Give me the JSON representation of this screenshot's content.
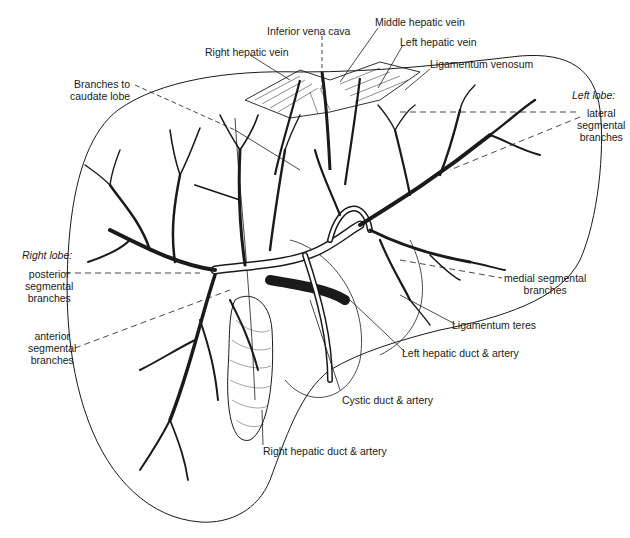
{
  "figure": {
    "style": "black-and-white pen illustration"
  },
  "labels": {
    "inferior_vena_cava": "Inferior vena cava",
    "middle_hepatic_vein": "Middle hepatic vein",
    "left_hepatic_vein": "Left hepatic vein",
    "right_hepatic_vein": "Right hepatic vein",
    "ligamentum_venosum": "Ligamentum venosum",
    "branches_to_caudate_lobe": [
      "Branches to",
      "caudate lobe"
    ],
    "left_lobe_heading": "Left lobe:",
    "left_lateral_segmental_branches": [
      "lateral",
      "segmental",
      "branches"
    ],
    "right_lobe_heading": "Right lobe:",
    "right_posterior_segmental_branches": [
      "posterior",
      "segmental",
      "branches"
    ],
    "right_anterior_segmental_branches": [
      "anterior",
      "segmental",
      "branches"
    ],
    "medial_segmental_branches": [
      "medial segmental",
      "branches"
    ],
    "ligamentum_teres": "Ligamentum teres",
    "left_hepatic_duct_artery": "Left hepatic duct & artery",
    "cystic_duct_artery": "Cystic duct & artery",
    "right_hepatic_duct_artery": "Right hepatic duct & artery"
  },
  "colors": {
    "ink": "#1a1a1a",
    "paper": "#ffffff"
  }
}
